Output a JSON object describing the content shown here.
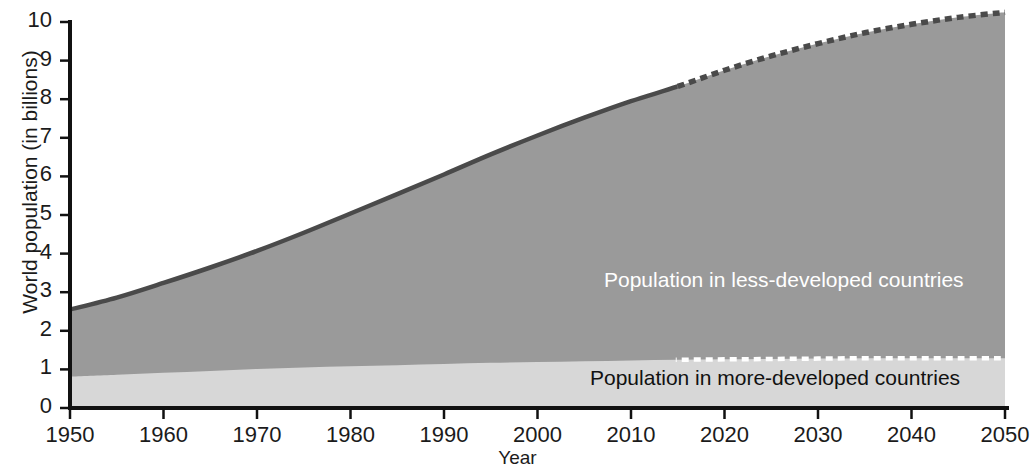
{
  "chart_data": {
    "type": "area",
    "title": "",
    "subtitle": "",
    "xlabel": "Year",
    "ylabel": "World population (in billions)",
    "xlim": [
      1950,
      2050
    ],
    "ylim": [
      0,
      10
    ],
    "grid": false,
    "legend_position": "inline-annotations",
    "stacked": true,
    "projection_starts": 2015,
    "x_tick_labels": [
      "1950",
      "1960",
      "1970",
      "1980",
      "1990",
      "2000",
      "2010",
      "2020",
      "2030",
      "2040",
      "2050"
    ],
    "y_tick_labels": [
      "0",
      "1",
      "2",
      "3",
      "4",
      "5",
      "6",
      "7",
      "8",
      "9",
      "10"
    ],
    "x": [
      1950,
      1955,
      1960,
      1965,
      1970,
      1975,
      1980,
      1985,
      1990,
      1995,
      2000,
      2005,
      2010,
      2015,
      2020,
      2025,
      2030,
      2035,
      2040,
      2045,
      2050
    ],
    "series": [
      {
        "name": "Population in more-developed countries",
        "color": "#d7d7d7",
        "values": [
          0.81,
          0.86,
          0.91,
          0.96,
          1.01,
          1.05,
          1.08,
          1.11,
          1.14,
          1.17,
          1.19,
          1.21,
          1.23,
          1.25,
          1.26,
          1.27,
          1.28,
          1.29,
          1.29,
          1.29,
          1.29
        ]
      },
      {
        "name": "Population in less-developed countries",
        "color": "#9a9a9a",
        "values": [
          1.74,
          2.0,
          2.33,
          2.68,
          3.06,
          3.49,
          3.96,
          4.43,
          4.91,
          5.4,
          5.87,
          6.31,
          6.72,
          7.08,
          7.49,
          7.85,
          8.16,
          8.43,
          8.65,
          8.83,
          8.96
        ]
      }
    ],
    "totals": [
      2.55,
      2.86,
      3.24,
      3.64,
      4.07,
      4.54,
      5.04,
      5.54,
      6.05,
      6.57,
      7.06,
      7.52,
      7.95,
      8.33,
      8.75,
      9.12,
      9.44,
      9.72,
      9.94,
      10.12,
      10.25
    ],
    "annotations": [
      {
        "id": "label-less-developed",
        "text": "Population in less-developed countries",
        "color": "#ffffff"
      },
      {
        "id": "label-more-developed",
        "text": "Population in more-developed countries",
        "color": "#111111"
      }
    ],
    "line_styles": {
      "historical": "solid",
      "projection": "dashed"
    },
    "outline_color": "#4a4a4a"
  },
  "axes": {
    "y_title": "World population (in billions)",
    "x_title": "Year",
    "y_ticks": [
      "0",
      "1",
      "2",
      "3",
      "4",
      "5",
      "6",
      "7",
      "8",
      "9",
      "10"
    ],
    "x_ticks": [
      "1950",
      "1960",
      "1970",
      "1980",
      "1990",
      "2000",
      "2010",
      "2020",
      "2030",
      "2040",
      "2050"
    ]
  },
  "labels": {
    "less_developed": "Population in less-developed countries",
    "more_developed": "Population in more-developed countries"
  }
}
